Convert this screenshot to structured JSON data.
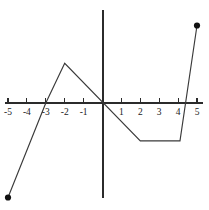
{
  "figure": {
    "width": 209,
    "height": 210,
    "background": "#ffffff",
    "title": "",
    "stroke_color": "#3a3a3a",
    "axis_color": "#2b2b2b",
    "point_color": "#111111"
  },
  "chart_data": {
    "type": "line",
    "title": "",
    "subtitle": "",
    "xlabel": "",
    "ylabel": "",
    "xlim": [
      -5,
      5
    ],
    "ylim": [
      -5,
      5
    ],
    "grid": false,
    "legend": "none",
    "x_axis": {
      "ticks": [
        -5,
        -4,
        -3,
        -2,
        -1,
        0,
        1,
        2,
        3,
        4,
        5
      ],
      "tick_labels": [
        "-5",
        "-4",
        "-3",
        "-2",
        "-1",
        "",
        "1",
        "2",
        "3",
        "4",
        "5"
      ],
      "tick_direction": "up",
      "visible": true
    },
    "y_axis": {
      "ticks": [],
      "tick_labels": [],
      "visible": true,
      "labels_shown": false
    },
    "series": [
      {
        "name": "piecewise-function",
        "kind": "piecewise-linear",
        "points": [
          {
            "x": -5,
            "y": -5
          },
          {
            "x": -3,
            "y": 0
          },
          {
            "x": -2,
            "y": 2.1
          },
          {
            "x": 2,
            "y": -2
          },
          {
            "x": 4.1,
            "y": -2
          },
          {
            "x": 5,
            "y": 4.1
          }
        ],
        "endpoints": [
          {
            "x": -5,
            "y": -5,
            "marker": "filled-circle"
          },
          {
            "x": 5,
            "y": 4.1,
            "marker": "filled-circle"
          }
        ]
      }
    ],
    "annotations": []
  },
  "geometry": {
    "origin_px": {
      "x": 102.5,
      "y": 103
    },
    "unit_px": 18.9,
    "x_axis_px": {
      "x1": 5,
      "x2": 203,
      "y": 103
    },
    "y_axis_px": {
      "y1": 10,
      "y2": 198,
      "x": 103
    },
    "tick_length_px": 5,
    "label_offset_px": 12,
    "dot_radius_px": 3.1
  }
}
